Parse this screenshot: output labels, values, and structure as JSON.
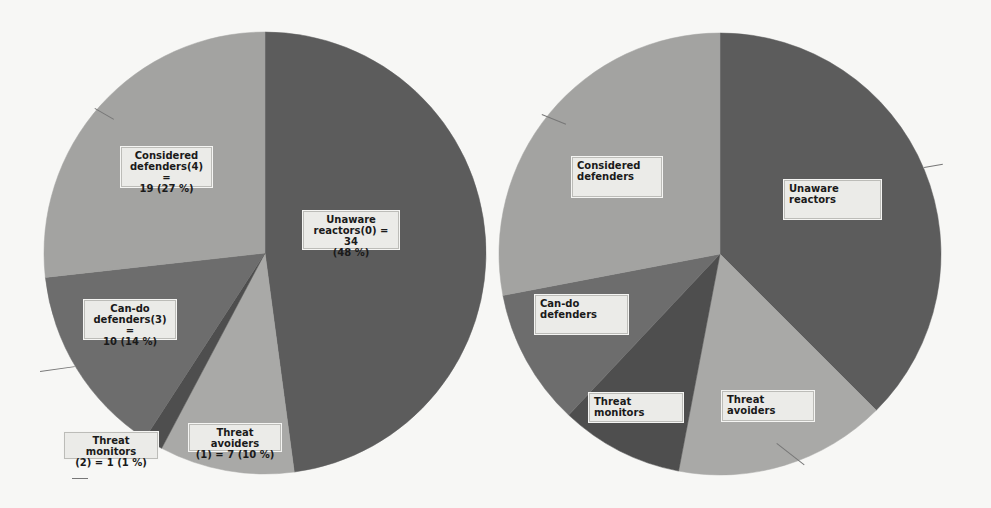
{
  "chart_data": [
    {
      "type": "pie",
      "title": "",
      "start_angle_deg": 0,
      "direction": "clockwise",
      "categories": [
        "Unaware reactors(0)",
        "Threat avoiders (1)",
        "Threat monitors (2)",
        "Can-do defenders(3)",
        "Considered defenders(4)"
      ],
      "values": [
        34,
        7,
        1,
        10,
        19
      ],
      "percentages": [
        48,
        10,
        1,
        14,
        27
      ],
      "colors": [
        "#5c5c5c",
        "#a9a9a7",
        "#4e4e4e",
        "#6d6d6d",
        "#a3a3a1"
      ],
      "labels": [
        "Unaware\nreactors(0) = 34\n(48 %)",
        "Threat avoiders\n(1) = 7 (10 %)",
        "Threat monitors\n(2) = 1 (1 %)",
        "Can-do\ndefenders(3) =\n10 (14 %)",
        "Considered\ndefenders(4) =\n19 (27 %)"
      ],
      "legend": "none"
    },
    {
      "type": "pie",
      "title": "",
      "start_angle_deg": 0,
      "direction": "clockwise",
      "categories": [
        "Unaware reactors",
        "Threat avoiders",
        "Threat monitors",
        "Can-do defenders",
        "Considered defenders"
      ],
      "values": [
        37.5,
        15.5,
        9,
        10,
        28
      ],
      "percentages": [
        37.5,
        15.5,
        9,
        10,
        28
      ],
      "colors": [
        "#5c5c5c",
        "#a9a9a7",
        "#4e4e4e",
        "#6d6d6d",
        "#a3a3a1"
      ],
      "labels": [
        "Unaware\nreactors",
        "Threat avoiders",
        "Threat monitors",
        "Can-do\ndefenders",
        "Considered\ndefenders"
      ],
      "legend": "none"
    }
  ],
  "charts": {
    "left": {
      "labels": {
        "unaware": "Unaware\nreactors(0) = 34\n(48 %)",
        "avoiders": "Threat avoiders\n(1) = 7 (10 %)",
        "monitors": "Threat monitors\n(2) = 1 (1 %)",
        "cando": "Can-do\ndefenders(3) =\n10 (14 %)",
        "considered": "Considered\ndefenders(4) =\n19 (27 %)"
      }
    },
    "right": {
      "labels": {
        "unaware": "    Unaware\nreactors",
        "avoiders": "Threat avoiders",
        "monitors": "Threat monitors",
        "cando": "    Can-do\ndefenders",
        "considered": "   Considered\ndefenders"
      }
    }
  }
}
